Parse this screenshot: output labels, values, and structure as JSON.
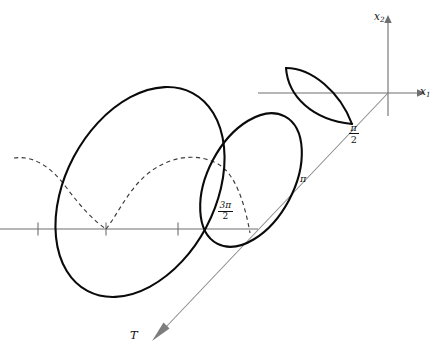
{
  "figure": {
    "kind": "mathematical-diagram",
    "background_color": "#ffffff",
    "curve_color": "#0a0a0a",
    "axis_color": "#6f6f6f",
    "dashed_color": "#3b3b3b",
    "t_axis_color": "#8a8a8a"
  },
  "axes": {
    "x1": {
      "label_main": "x",
      "label_sub": "1",
      "label_x": 421,
      "label_y": 88,
      "origin": [
        388,
        93
      ],
      "left_end": [
        0,
        93
      ],
      "arrow_tip": [
        418,
        93
      ]
    },
    "x2": {
      "label_main": "x",
      "label_sub": "2",
      "label_x": 375,
      "label_y": 14,
      "origin": [
        388,
        93
      ],
      "top_end": [
        388,
        18
      ],
      "bottom_end": [
        388,
        116
      ],
      "arrow_tip": [
        388,
        18
      ]
    },
    "t": {
      "label": "T",
      "label_x": 131,
      "label_y": 331,
      "start": [
        388,
        93
      ],
      "arrow_tip": [
        170,
        330
      ]
    },
    "horizontal_ground": {
      "y": 229,
      "left_end": [
        0,
        229
      ],
      "right_end": [
        258,
        229
      ],
      "ticks_x": [
        38,
        106,
        178
      ]
    }
  },
  "tick_labels": [
    {
      "name": "pi-over-two",
      "numerator": "π",
      "denominator": "2",
      "x": 355,
      "y": 124,
      "point": [
        352,
        124
      ]
    },
    {
      "name": "pi",
      "text": "π",
      "x": 303,
      "y": 173,
      "point": [
        302,
        180
      ]
    },
    {
      "name": "three-pi-over-two",
      "numerator": "3π",
      "denominator": "2",
      "x": 222,
      "y": 203,
      "point": [
        250,
        233
      ]
    }
  ],
  "shapes": [
    {
      "name": "large-ellipse",
      "type": "tilted-ellipse",
      "center": [
        140,
        192
      ],
      "rx": 112,
      "ry": 75,
      "rotation_deg": -62
    },
    {
      "name": "middle-ellipse",
      "type": "tilted-ellipse",
      "center": [
        251,
        180
      ],
      "rx": 72,
      "ry": 43,
      "rotation_deg": -62
    },
    {
      "name": "small-lens",
      "type": "lens",
      "tip_left": [
        286,
        68
      ],
      "tip_right": [
        352,
        124
      ]
    },
    {
      "name": "cycloid-dashed-arches",
      "type": "dashed-cycloid",
      "cusp": [
        106,
        229
      ],
      "left_start": [
        14,
        158
      ],
      "right_end": [
        250,
        233
      ]
    }
  ]
}
